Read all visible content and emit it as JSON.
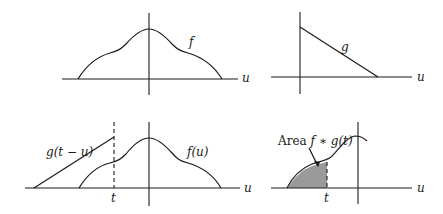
{
  "panels": {
    "top_left": {
      "curve_label": "f",
      "axis_label": "u"
    },
    "top_right": {
      "curve_label": "g",
      "axis_label": "u"
    },
    "bottom_left": {
      "shifted_label": "g(t − u)",
      "curve_label": "f(u)",
      "axis_label": "u",
      "t_label": "t"
    },
    "bottom_right": {
      "area_prefix": "Area ",
      "area_expr": "f ∗ g(t)",
      "axis_label": "u",
      "t_label": "t"
    }
  },
  "colors": {
    "ink": "#1a1a1a",
    "shade": "#9a9a9a",
    "background": "#ffffff"
  }
}
